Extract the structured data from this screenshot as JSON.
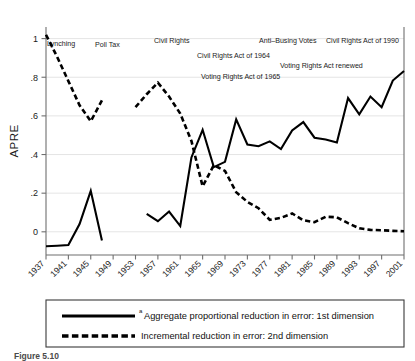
{
  "chart_data": {
    "type": "line",
    "title": "",
    "xlabel": "",
    "ylabel": "APRE",
    "xlim": [
      1937,
      2001
    ],
    "ylim": [
      -0.12,
      1.06
    ],
    "grid": true,
    "legend_position": "below-plot",
    "y_ticks": [
      "0",
      ".2",
      ".4",
      ".6",
      ".8",
      "1"
    ],
    "y_tick_values": [
      0,
      0.2,
      0.4,
      0.6,
      0.8,
      1.0
    ],
    "x_ticks": [
      "1937",
      "1941",
      "1945",
      "1949",
      "1953",
      "1957",
      "1961",
      "1965",
      "1969",
      "1973",
      "1977",
      "1981",
      "1985",
      "1989",
      "1993",
      "1997",
      "2001"
    ],
    "x_tick_values": [
      1937,
      1941,
      1945,
      1949,
      1953,
      1957,
      1961,
      1965,
      1969,
      1973,
      1977,
      1981,
      1985,
      1989,
      1993,
      1997,
      2001
    ],
    "series": [
      {
        "name": "Aggregate proportional reduction in error: 1st dimension",
        "style": "solid",
        "segments": [
          {
            "x": [
              1937,
              1939,
              1941,
              1943,
              1945,
              1947
            ],
            "values": [
              -0.075,
              -0.072,
              -0.068,
              0.04,
              0.212,
              -0.045
            ]
          },
          {
            "x": [
              1955,
              1957,
              1959,
              1961,
              1963,
              1965,
              1967,
              1969,
              1971,
              1973,
              1975,
              1977,
              1979,
              1981,
              1983,
              1985,
              1987,
              1989,
              1991,
              1993,
              1995,
              1997,
              1999,
              2001
            ],
            "values": [
              0.093,
              0.055,
              0.105,
              0.03,
              0.385,
              0.528,
              0.335,
              0.362,
              0.582,
              0.452,
              0.443,
              0.468,
              0.428,
              0.525,
              0.568,
              0.487,
              0.478,
              0.462,
              0.692,
              0.608,
              0.7,
              0.645,
              0.783,
              0.832
            ]
          }
        ]
      },
      {
        "name": "Incremental reduction in error: 2nd dimension",
        "style": "dashed",
        "segments": [
          {
            "x": [
              1937,
              1939,
              1941,
              1943,
              1945,
              1947
            ],
            "values": [
              1.02,
              0.905,
              0.78,
              0.655,
              0.572,
              0.68
            ]
          },
          {
            "x": [
              1953,
              1955,
              1957,
              1959,
              1961,
              1963,
              1965,
              1967,
              1969,
              1971,
              1973,
              1975,
              1977,
              1979,
              1981,
              1983,
              1985,
              1987,
              1989,
              1991,
              1993,
              1995,
              1997,
              1999,
              2001
            ],
            "values": [
              0.645,
              0.712,
              0.772,
              0.7,
              0.612,
              0.47,
              0.235,
              0.345,
              0.315,
              0.205,
              0.155,
              0.122,
              0.062,
              0.072,
              0.095,
              0.06,
              0.05,
              0.078,
              0.075,
              0.045,
              0.018,
              0.01,
              0.008,
              0.005,
              0.003
            ]
          }
        ]
      }
    ],
    "annotations": [
      {
        "label": "Lynching",
        "x_px": 47,
        "y_px": 46,
        "anchor": "start"
      },
      {
        "label": "Poll Tax",
        "x_px": 95,
        "y_px": 47,
        "anchor": "start"
      },
      {
        "label": "Civil Rights",
        "x_px": 154,
        "y_px": 43,
        "anchor": "start"
      },
      {
        "label": "Civil Rights Act of 1964",
        "x_px": 197,
        "y_px": 58,
        "anchor": "start"
      },
      {
        "label": "Voting Rights Act of 1965",
        "x_px": 201,
        "y_px": 79,
        "anchor": "start"
      },
      {
        "label": "Anti–Busing Votes",
        "x_px": 259,
        "y_px": 43,
        "anchor": "start"
      },
      {
        "label": "Voting Rights Act renewed",
        "x_px": 280,
        "y_px": 68,
        "anchor": "start"
      },
      {
        "label": "Civil Rights Act of 1990",
        "x_px": 326,
        "y_px": 43,
        "anchor": "start"
      }
    ]
  },
  "legend": {
    "items": [
      {
        "marker": "solid-line",
        "footnote": "a",
        "label": "Aggregate proportional reduction in error: 1st dimension"
      },
      {
        "marker": "dashed-line",
        "footnote": "",
        "label": "Incremental reduction in error: 2nd dimension"
      }
    ]
  },
  "caption": {
    "text": "Figure 5.10"
  }
}
